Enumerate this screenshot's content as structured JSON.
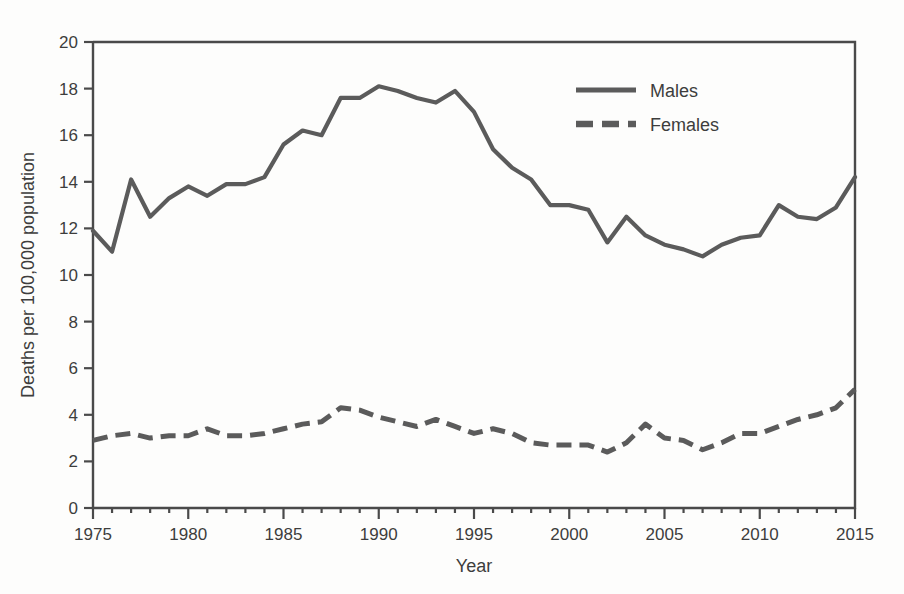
{
  "chart_data": {
    "type": "line",
    "title": "",
    "xlabel": "Year",
    "ylabel": "Deaths per 100,000 population",
    "xlim": [
      1975,
      2015
    ],
    "ylim": [
      0,
      20
    ],
    "grid": false,
    "legend_position": "top-right",
    "x_tick_labels": [
      "1975",
      "1980",
      "1985",
      "1990",
      "1995",
      "2000",
      "2005",
      "2010",
      "2015"
    ],
    "x_tick_values": [
      1975,
      1980,
      1985,
      1990,
      1995,
      2000,
      2005,
      2010,
      2015
    ],
    "x_minor_tick_values": [
      1976,
      1977,
      1978,
      1979,
      1981,
      1982,
      1983,
      1984,
      1986,
      1987,
      1988,
      1989,
      1991,
      1992,
      1993,
      1994,
      1996,
      1997,
      1998,
      1999,
      2001,
      2002,
      2003,
      2004,
      2006,
      2007,
      2008,
      2009,
      2011,
      2012,
      2013,
      2014
    ],
    "y_tick_labels": [
      "0",
      "2",
      "4",
      "6",
      "8",
      "10",
      "12",
      "14",
      "16",
      "18",
      "20"
    ],
    "y_tick_values": [
      0,
      2,
      4,
      6,
      8,
      10,
      12,
      14,
      16,
      18,
      20
    ],
    "x": [
      1975,
      1976,
      1977,
      1978,
      1979,
      1980,
      1981,
      1982,
      1983,
      1984,
      1985,
      1986,
      1987,
      1988,
      1989,
      1990,
      1991,
      1992,
      1993,
      1994,
      1995,
      1996,
      1997,
      1998,
      1999,
      2000,
      2001,
      2002,
      2003,
      2004,
      2005,
      2006,
      2007,
      2008,
      2009,
      2010,
      2011,
      2012,
      2013,
      2014,
      2015
    ],
    "series": [
      {
        "name": "Males",
        "style": "solid",
        "color": "#5b5b5b",
        "values": [
          11.9,
          11.0,
          14.1,
          12.5,
          13.3,
          13.8,
          13.4,
          13.9,
          13.9,
          14.2,
          15.6,
          16.2,
          16.0,
          17.6,
          17.6,
          18.1,
          17.9,
          17.6,
          17.4,
          17.9,
          17.0,
          15.4,
          14.6,
          14.1,
          13.0,
          13.0,
          12.8,
          11.4,
          12.5,
          11.7,
          11.3,
          11.1,
          10.8,
          11.3,
          11.6,
          11.7,
          13.0,
          12.5,
          12.4,
          12.9,
          14.2
        ]
      },
      {
        "name": "Females",
        "style": "dashed",
        "color": "#5b5b5b",
        "values": [
          2.9,
          3.1,
          3.2,
          3.0,
          3.1,
          3.1,
          3.4,
          3.1,
          3.1,
          3.2,
          3.4,
          3.6,
          3.7,
          4.3,
          4.2,
          3.9,
          3.7,
          3.5,
          3.8,
          3.5,
          3.2,
          3.4,
          3.2,
          2.8,
          2.7,
          2.7,
          2.7,
          2.4,
          2.8,
          3.6,
          3.0,
          2.9,
          2.5,
          2.8,
          3.2,
          3.2,
          3.5,
          3.8,
          4.0,
          4.3,
          5.1
        ]
      }
    ]
  },
  "legend": {
    "entries": [
      {
        "label": "Males"
      },
      {
        "label": "Females"
      }
    ]
  }
}
